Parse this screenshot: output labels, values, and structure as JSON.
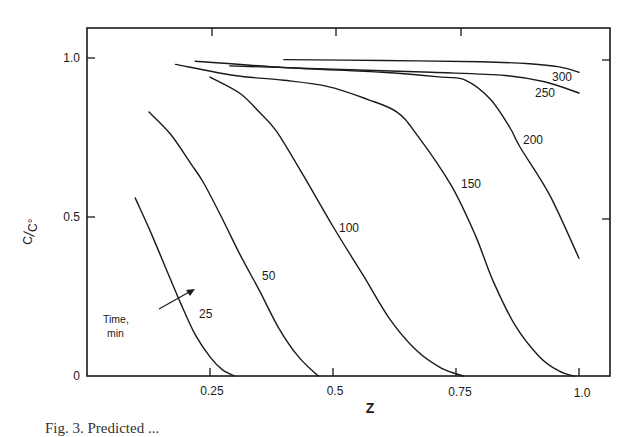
{
  "chart_data": {
    "type": "line",
    "title": "",
    "xlabel": "Z",
    "ylabel": "C/C°",
    "xlim": [
      0,
      1.05
    ],
    "ylim": [
      0,
      1.1
    ],
    "grid": false,
    "legend": "none (inline curve labels)",
    "x_ticks": [
      0.25,
      0.5,
      0.75,
      1.0
    ],
    "x_tick_labels": [
      "0.25",
      "0.5",
      "0.75",
      "1.0"
    ],
    "y_ticks": [
      0,
      0.5,
      1.0
    ],
    "y_tick_labels": [
      "0",
      "0.5",
      "1.0"
    ],
    "annotation": {
      "text_line1": "Time,",
      "text_line2": "min",
      "arrow": "points across curves in direction of increasing time"
    },
    "series": [
      {
        "name": "25",
        "unit": "min",
        "points": [
          [
            0.098,
            0.56
          ],
          [
            0.13,
            0.45
          ],
          [
            0.16,
            0.34
          ],
          [
            0.19,
            0.23
          ],
          [
            0.22,
            0.13
          ],
          [
            0.25,
            0.06
          ],
          [
            0.275,
            0.02
          ],
          [
            0.3,
            0.0
          ]
        ]
      },
      {
        "name": "50",
        "unit": "min",
        "points": [
          [
            0.126,
            0.83
          ],
          [
            0.17,
            0.76
          ],
          [
            0.21,
            0.67
          ],
          [
            0.236,
            0.61
          ],
          [
            0.27,
            0.51
          ],
          [
            0.31,
            0.385
          ],
          [
            0.35,
            0.27
          ],
          [
            0.39,
            0.15
          ],
          [
            0.43,
            0.06
          ],
          [
            0.47,
            0.0
          ]
        ]
      },
      {
        "name": "100",
        "unit": "min",
        "points": [
          [
            0.25,
            0.94
          ],
          [
            0.31,
            0.89
          ],
          [
            0.35,
            0.83
          ],
          [
            0.385,
            0.77
          ],
          [
            0.44,
            0.63
          ],
          [
            0.5,
            0.47
          ],
          [
            0.56,
            0.32
          ],
          [
            0.615,
            0.18
          ],
          [
            0.67,
            0.08
          ],
          [
            0.72,
            0.025
          ],
          [
            0.765,
            0.0
          ]
        ]
      },
      {
        "name": "150",
        "unit": "min",
        "points": [
          [
            0.18,
            0.98
          ],
          [
            0.3,
            0.945
          ],
          [
            0.4,
            0.93
          ],
          [
            0.49,
            0.91
          ],
          [
            0.57,
            0.87
          ],
          [
            0.63,
            0.83
          ],
          [
            0.67,
            0.76
          ],
          [
            0.74,
            0.6
          ],
          [
            0.79,
            0.44
          ],
          [
            0.825,
            0.3
          ],
          [
            0.87,
            0.16
          ],
          [
            0.92,
            0.06
          ],
          [
            0.96,
            0.015
          ],
          [
            0.99,
            0.0
          ]
        ]
      },
      {
        "name": "200",
        "unit": "min",
        "points": [
          [
            0.22,
            0.99
          ],
          [
            0.4,
            0.97
          ],
          [
            0.6,
            0.955
          ],
          [
            0.72,
            0.94
          ],
          [
            0.77,
            0.93
          ],
          [
            0.82,
            0.87
          ],
          [
            0.86,
            0.78
          ],
          [
            0.88,
            0.72
          ],
          [
            0.94,
            0.57
          ],
          [
            1.0,
            0.37
          ]
        ]
      },
      {
        "name": "250",
        "unit": "min",
        "points": [
          [
            0.29,
            0.975
          ],
          [
            0.5,
            0.965
          ],
          [
            0.7,
            0.955
          ],
          [
            0.85,
            0.945
          ],
          [
            0.93,
            0.925
          ],
          [
            1.0,
            0.89
          ]
        ]
      },
      {
        "name": "300",
        "unit": "min",
        "points": [
          [
            0.4,
            0.995
          ],
          [
            0.6,
            0.992
          ],
          [
            0.8,
            0.988
          ],
          [
            0.9,
            0.982
          ],
          [
            0.96,
            0.972
          ],
          [
            1.0,
            0.955
          ]
        ]
      }
    ]
  },
  "labels": {
    "x_axis_title": "Z",
    "y_axis_title_num": "C",
    "y_axis_title_den": "C°",
    "time_note_1": "Time,",
    "time_note_2": "min",
    "x_ticks": [
      "0.25",
      "0.5",
      "0.75",
      "1.0"
    ],
    "y_ticks": [
      "0",
      "0.5",
      "1.0"
    ],
    "curves": [
      "25",
      "50",
      "100",
      "150",
      "200",
      "250",
      "300"
    ]
  },
  "caption": "Fig. 3. Predicted ..."
}
